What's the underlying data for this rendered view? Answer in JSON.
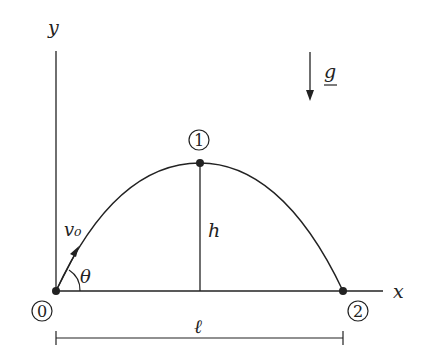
{
  "diagram": {
    "type": "projectile-motion",
    "axes": {
      "x_label": "x",
      "y_label": "y"
    },
    "gravity_label": "g",
    "velocity_label": "v₀",
    "angle_label": "θ",
    "height_label": "h",
    "range_label": "ℓ",
    "points": [
      {
        "id": "0",
        "label": "0"
      },
      {
        "id": "1",
        "label": "1"
      },
      {
        "id": "2",
        "label": "2"
      }
    ],
    "colors": {
      "stroke": "#222222",
      "background": "#ffffff"
    }
  }
}
